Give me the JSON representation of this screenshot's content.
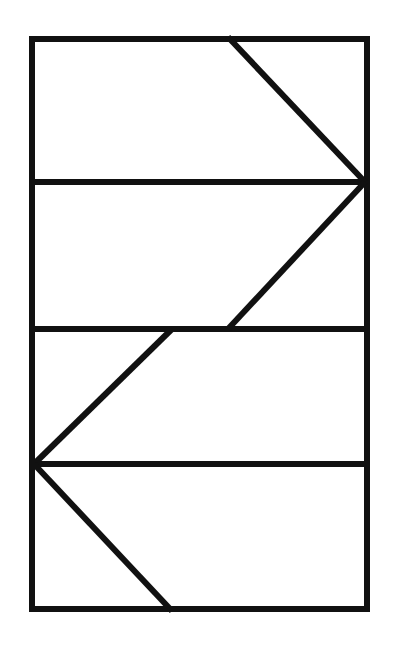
{
  "figure": {
    "canvas": {
      "width": 400,
      "height": 647,
      "background_color": "#FFFFFF"
    },
    "stroke": {
      "color": "#111111",
      "width": 6,
      "diagonal_width": 6
    },
    "frame": {
      "name": "outer-rectangle",
      "left": 32,
      "top": 39,
      "right": 367,
      "bottom": 609
    },
    "horizontal_lines": [
      {
        "name": "horizontal-divider-1",
        "y": 182,
        "x1": 29,
        "x2": 370
      },
      {
        "name": "horizontal-divider-2",
        "y": 329,
        "x1": 29,
        "x2": 370
      },
      {
        "name": "horizontal-divider-3",
        "y": 464,
        "x1": 35,
        "x2": 370
      }
    ],
    "diagonal_lines": [
      {
        "name": "diagonal-top-descending",
        "x1": 228,
        "y1": 37,
        "x2": 365,
        "y2": 182
      },
      {
        "name": "diagonal-upper-ascending",
        "x1": 365,
        "y1": 182,
        "x2": 228,
        "y2": 329
      },
      {
        "name": "diagonal-lower-descending",
        "x1": 172,
        "y1": 329,
        "x2": 34,
        "y2": 464
      },
      {
        "name": "diagonal-bottom-ascending",
        "x1": 34,
        "y1": 464,
        "x2": 172,
        "y2": 611
      }
    ],
    "vertices": [
      {
        "name": "vertex-right-apex",
        "x": 365,
        "y": 182
      },
      {
        "name": "vertex-left-apex",
        "x": 34,
        "y": 464
      }
    ]
  }
}
